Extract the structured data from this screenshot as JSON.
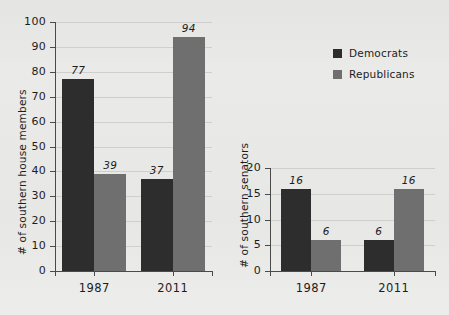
{
  "legend": {
    "position": "top-right",
    "items": [
      {
        "label": "Democrats",
        "color": "#2d2d2d",
        "swatch": "dem"
      },
      {
        "label": "Republicans",
        "color": "#6f6f6f",
        "swatch": "rep"
      }
    ]
  },
  "chart_data": [
    {
      "id": "house",
      "type": "bar",
      "title": "",
      "xlabel": "",
      "ylabel": "# of southern house members",
      "categories": [
        "1987",
        "2011"
      ],
      "series": [
        {
          "name": "Democrats",
          "color": "#2d2d2d",
          "values": [
            77,
            37
          ]
        },
        {
          "name": "Republicans",
          "color": "#6f6f6f",
          "values": [
            39,
            94
          ]
        }
      ],
      "ylim": [
        0,
        100
      ],
      "yticks": [
        0,
        10,
        20,
        30,
        40,
        50,
        60,
        70,
        80,
        90,
        100
      ],
      "grid": true
    },
    {
      "id": "senate",
      "type": "bar",
      "title": "",
      "xlabel": "",
      "ylabel": "# of southern senators",
      "categories": [
        "1987",
        "2011"
      ],
      "series": [
        {
          "name": "Democrats",
          "color": "#2d2d2d",
          "values": [
            16,
            6
          ]
        },
        {
          "name": "Republicans",
          "color": "#6f6f6f",
          "values": [
            6,
            16
          ]
        }
      ],
      "ylim": [
        0,
        20
      ],
      "yticks": [
        0,
        5,
        10,
        15,
        20
      ],
      "grid": true
    }
  ]
}
